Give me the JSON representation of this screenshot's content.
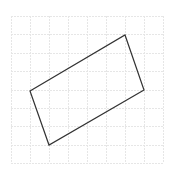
{
  "canvas": {
    "width": 174,
    "height": 176,
    "background": "#ffffff"
  },
  "grid": {
    "x0": 11,
    "y0": 16,
    "x1": 163,
    "y1": 163,
    "columns": 8,
    "rows": 8,
    "color": "#e6e6e6",
    "dash": "2,1"
  },
  "shape": {
    "type": "rotated-rectangle",
    "stroke": "#333333",
    "stroke_width": 1.2,
    "points": [
      [
        30,
        91
      ],
      [
        125,
        35
      ],
      [
        144,
        90
      ],
      [
        49,
        145
      ]
    ]
  }
}
